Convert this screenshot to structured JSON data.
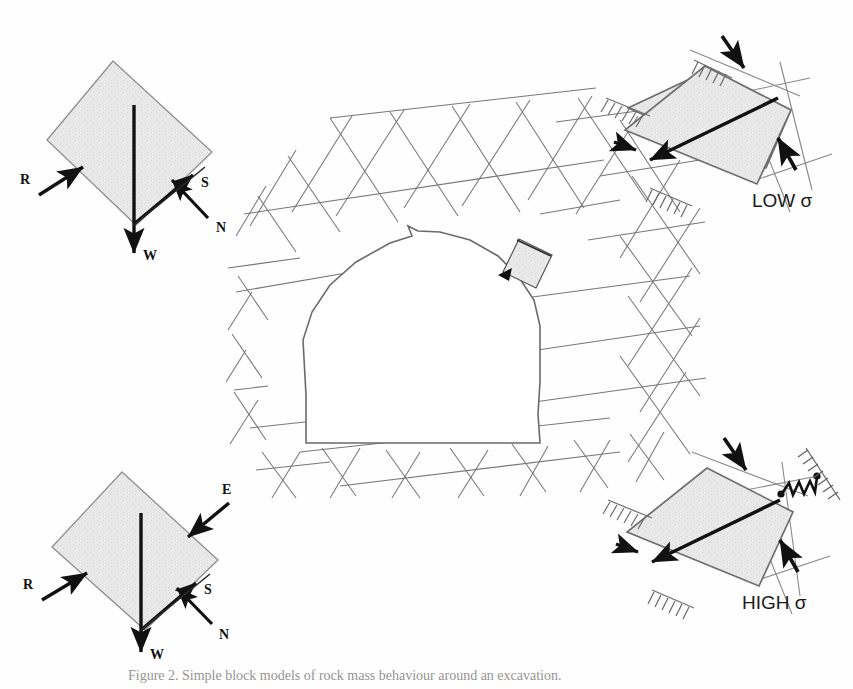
{
  "figure": {
    "caption": "Figure 2. Simple block models of rock mass behaviour around an excavation.",
    "block_fill": "#e9e9e9",
    "block_stroke": "#8a8a8a",
    "joint_stroke": "#6f6f6f",
    "arrow_color": "#111111",
    "tunnel_stroke": "#6a6a6a"
  },
  "panels": {
    "top_left": {
      "name": "free-body-no-external-load",
      "labels": {
        "r": "R",
        "s": "S",
        "n": "N",
        "w": "W"
      }
    },
    "bottom_left": {
      "name": "free-body-with-external-load",
      "labels": {
        "e": "E",
        "r": "R",
        "s": "S",
        "n": "N",
        "w": "W"
      }
    },
    "top_right": {
      "name": "low-normal-stress-block",
      "label": "LOW σ"
    },
    "bottom_right": {
      "name": "high-normal-stress-block",
      "label": "HIGH σ"
    }
  },
  "center": {
    "name": "jointed-rock-mass-tunnel-section",
    "key_block_note": "",
    "joint_sets": 3
  }
}
